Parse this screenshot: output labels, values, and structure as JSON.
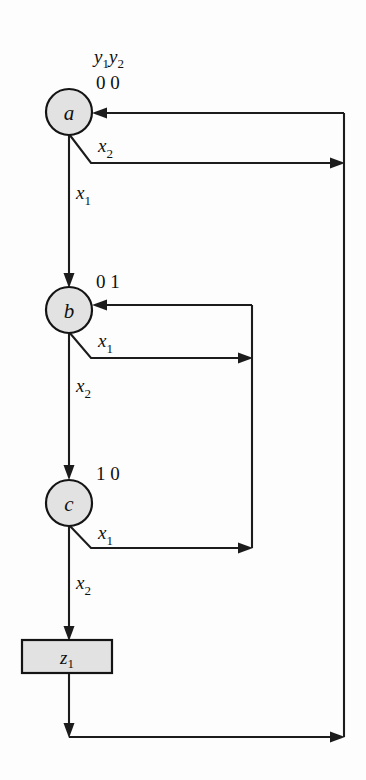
{
  "figure": {
    "name": "state-transition-flowchart",
    "background_color": "#fdfdfd",
    "line_color": "#1c1c1c",
    "node_fill_color": "#e2e2e2",
    "width": 366,
    "height": 780
  },
  "header": {
    "state_vars_y1": "y",
    "state_vars_y1_sub": "1",
    "state_vars_y2": "y",
    "state_vars_y2_sub": "2"
  },
  "nodes": [
    {
      "id": "a",
      "label": "a",
      "state_code": "0 0",
      "cx": 69,
      "cy": 112,
      "r": 23
    },
    {
      "id": "b",
      "label": "b",
      "state_code": "0 1",
      "cx": 69,
      "cy": 310,
      "r": 23
    },
    {
      "id": "c",
      "label": "c",
      "state_code": "1 0",
      "cx": 69,
      "cy": 503,
      "r": 23
    }
  ],
  "output_box": {
    "id": "z1",
    "label": "z",
    "label_sub": "1",
    "x": 22,
    "y": 640,
    "width": 90,
    "height": 33
  },
  "edges": [
    {
      "id": "a-x1-to-b",
      "label": "x",
      "label_sub": "1",
      "from": "a",
      "to": "b",
      "kind": "vertical-down"
    },
    {
      "id": "a-x2-to-right-bus",
      "label": "x",
      "label_sub": "2",
      "from": "a",
      "to": "right-return-bus",
      "kind": "diagonal-then-horizontal-right"
    },
    {
      "id": "b-x1-to-b-loop",
      "label": "x",
      "label_sub": "1",
      "from": "b",
      "to": "b",
      "kind": "self-loop-right"
    },
    {
      "id": "b-x2-to-c",
      "label": "x",
      "label_sub": "2",
      "from": "b",
      "to": "c",
      "kind": "vertical-down"
    },
    {
      "id": "c-x1-to-b",
      "label": "x",
      "label_sub": "1",
      "from": "c",
      "to": "b",
      "kind": "right-then-up"
    },
    {
      "id": "c-x2-to-z1",
      "label": "x",
      "label_sub": "2",
      "from": "c",
      "to": "z1",
      "kind": "vertical-down"
    },
    {
      "id": "z1-to-a-return",
      "label": "",
      "label_sub": "",
      "from": "z1",
      "to": "a",
      "kind": "down-right-up-return"
    }
  ],
  "labels": {
    "edge_a_x2": "x",
    "edge_a_x2_sub": "2",
    "edge_a_x1": "x",
    "edge_a_x1_sub": "1",
    "edge_b_x1": "x",
    "edge_b_x1_sub": "1",
    "edge_b_x2": "x",
    "edge_b_x2_sub": "2",
    "edge_c_x1": "x",
    "edge_c_x1_sub": "1",
    "edge_c_x2": "x",
    "edge_c_x2_sub": "2"
  }
}
